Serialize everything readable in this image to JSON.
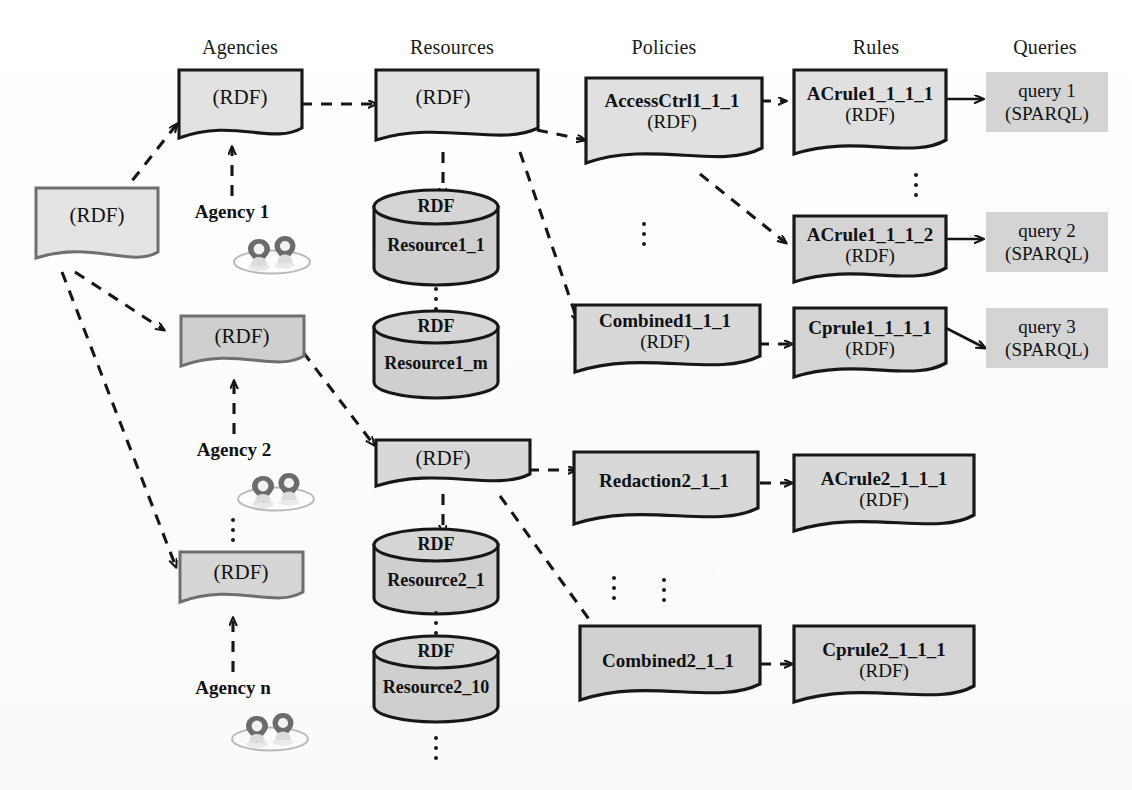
{
  "columns": [
    {
      "id": "agencies",
      "label": "Agencies",
      "x": 240
    },
    {
      "id": "resources",
      "label": "Resources",
      "x": 452
    },
    {
      "id": "policies",
      "label": "Policies",
      "x": 664
    },
    {
      "id": "rules",
      "label": "Rules",
      "x": 876
    },
    {
      "id": "queries",
      "label": "Queries",
      "x": 1040
    }
  ],
  "nodes": {
    "root_rdf": {
      "label": "(RDF)",
      "shape": "document"
    },
    "agency1_rdf": {
      "label": "(RDF)",
      "shape": "document"
    },
    "agency2_rdf": {
      "label": "(RDF)",
      "shape": "document"
    },
    "agencyn_rdf": {
      "label": "(RDF)",
      "shape": "document"
    },
    "resources1_rdf": {
      "label": "(RDF)",
      "shape": "document"
    },
    "resources2_rdf": {
      "label": "(RDF)",
      "shape": "document"
    },
    "resource1_1": {
      "top": "RDF",
      "name": "Resource1_1",
      "shape": "cylinder"
    },
    "resource1_m": {
      "top": "RDF",
      "name": "Resource1_m",
      "shape": "cylinder"
    },
    "resource2_1": {
      "top": "RDF",
      "name": "Resource2_1",
      "shape": "cylinder"
    },
    "resource2_10": {
      "top": "RDF",
      "name": "Resource2_10",
      "shape": "cylinder"
    },
    "accessctrl1": {
      "name": "AccessCtrl1_1_1",
      "sub": "(RDF)",
      "shape": "document"
    },
    "combined1": {
      "name": "Combined1_1_1",
      "sub": "(RDF)",
      "shape": "document"
    },
    "redaction2": {
      "name": "Redaction2_1_1",
      "sub": "",
      "shape": "document"
    },
    "combined2": {
      "name": "Combined2_1_1",
      "sub": "",
      "shape": "document"
    },
    "acrule1_1": {
      "name": "ACrule1_1_1_1",
      "sub": "(RDF)",
      "shape": "document"
    },
    "acrule1_2": {
      "name": "ACrule1_1_1_2",
      "sub": "(RDF)",
      "shape": "document"
    },
    "cprule1": {
      "name": "Cprule1_1_1_1",
      "sub": "(RDF)",
      "shape": "document"
    },
    "acrule2": {
      "name": "ACrule2_1_1_1",
      "sub": "(RDF)",
      "shape": "document"
    },
    "cprule2": {
      "name": "Cprule2_1_1_1",
      "sub": "(RDF)",
      "shape": "document"
    },
    "query1": {
      "line1": "query 1",
      "line2": "(SPARQL)",
      "shape": "plain"
    },
    "query2": {
      "line1": "query 2",
      "line2": "(SPARQL)",
      "shape": "plain"
    },
    "query3": {
      "line1": "query 3",
      "line2": "(SPARQL)",
      "shape": "plain"
    }
  },
  "agencies": [
    {
      "id": "agency1",
      "label": "Agency 1"
    },
    {
      "id": "agency2",
      "label": "Agency 2"
    },
    {
      "id": "agencyn",
      "label": "Agency n"
    }
  ],
  "colors": {
    "fill_light": "#e4e4e4",
    "fill_mid": "#d2d2d2",
    "fill_dark": "#c9c9c9",
    "query_fill": "#d4d4d4",
    "stroke": "#161616",
    "stroke_soft": "#6a6a6a",
    "background": "#fdfdfc",
    "text": "#111111"
  },
  "edge_styles": {
    "flow": "dashed",
    "membership": "solid"
  }
}
